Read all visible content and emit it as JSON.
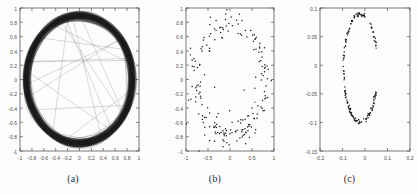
{
  "figure": {
    "background_color": "#fdfdfd",
    "axis_color": "#555555",
    "data_color": "#1a1a1a",
    "panels": [
      {
        "id": "a",
        "caption": "(a)",
        "chart_data": {
          "type": "line",
          "title": "",
          "xlabel": "",
          "ylabel": "",
          "xlim": [
            -1,
            1
          ],
          "ylim": [
            -1,
            1
          ],
          "xticks": [
            "-1",
            "-0.8",
            "-0.6",
            "-0.4",
            "-0.2",
            "0",
            "0.2",
            "0.4",
            "0.6",
            "0.8",
            "1"
          ],
          "xtick_values": [
            -1,
            -0.8,
            -0.6,
            -0.4,
            -0.2,
            0,
            0.2,
            0.4,
            0.6,
            0.8,
            1
          ],
          "yticks": [
            "1",
            "0.8",
            "0.6",
            "0.4",
            "0.2",
            "0",
            "-0.2",
            "-0.4",
            "-0.6",
            "-0.8",
            "-1"
          ],
          "ytick_values": [
            1,
            0.8,
            0.6,
            0.4,
            0.2,
            0,
            -0.2,
            -0.4,
            -0.6,
            -0.8,
            -1
          ],
          "grid": false,
          "legend": "none",
          "description": "Dense overlapping trajectories forming a thick annulus of radius about 0.93 with a hollow white interior; several straight chord segments cut across the ring.",
          "ring_radius": 0.93,
          "ring_thickness": 0.1,
          "trajectory_count": 120,
          "chord_count": 14
        }
      },
      {
        "id": "b",
        "caption": "(b)",
        "chart_data": {
          "type": "scatter",
          "title": "",
          "xlabel": "",
          "ylabel": "",
          "xlim": [
            -1,
            1
          ],
          "ylim": [
            -1,
            1
          ],
          "xticks": [
            "-1",
            "-0.5",
            "0",
            "0.5",
            "1"
          ],
          "xtick_values": [
            -1,
            -0.5,
            0,
            0.5,
            1
          ],
          "yticks": [
            "1",
            "0.8",
            "0.6",
            "0.4",
            "0.2",
            "0",
            "-0.2",
            "-0.4",
            "-0.6",
            "-0.8",
            "-1"
          ],
          "ytick_values": [
            1,
            0.8,
            0.6,
            0.4,
            0.2,
            0,
            -0.2,
            -0.4,
            -0.6,
            -0.8,
            -1
          ],
          "grid": false,
          "legend": "none",
          "description": "Noisy scatter of about 190 points loosely distributed around a ring of mean radius 0.78 with radial scatter of roughly 0.09; interior is empty.",
          "point_count": 190,
          "mean_radius": 0.78,
          "radial_noise": 0.09
        }
      },
      {
        "id": "c",
        "caption": "(c)",
        "chart_data": {
          "type": "scatter",
          "title": "",
          "xlabel": "",
          "ylabel": "",
          "xlim": [
            -0.2,
            0.2
          ],
          "ylim": [
            -0.15,
            0.1
          ],
          "xticks": [
            "-0.2",
            "-0.1",
            "0",
            "0.1",
            "0.2"
          ],
          "xtick_values": [
            -0.2,
            -0.1,
            0,
            0.1,
            0.2
          ],
          "yticks": [
            "0.1",
            "0.05",
            "0",
            "-0.05",
            "-0.1",
            "-0.15"
          ],
          "ytick_values": [
            0.1,
            0.05,
            0,
            -0.05,
            -0.1,
            -0.15
          ],
          "grid": false,
          "legend": "none",
          "description": "Tight, nearly closed elliptical ring of small dots centred near (-0.02, -0.005), semi-axis 0.075 in x and 0.095 in y, with a visible gap on the right side near y = 0.",
          "point_count": 210,
          "center": [
            -0.02,
            -0.005
          ],
          "semi_axis_x": 0.075,
          "semi_axis_y": 0.095,
          "gap_location": "right side near y = 0"
        }
      }
    ]
  }
}
